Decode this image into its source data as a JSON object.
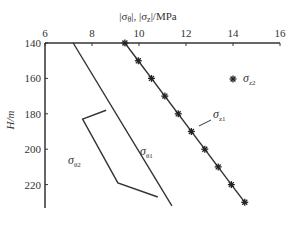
{
  "chart_data": {
    "type": "line",
    "title": "",
    "xlabel": "|σθ|, |σz|/MPa",
    "ylabel": "H/m",
    "x_axis_position": "top",
    "y_inverted": true,
    "xlim": [
      6,
      16
    ],
    "ylim": [
      140,
      232
    ],
    "xticks": [
      6,
      8,
      10,
      12,
      14,
      16
    ],
    "yticks": [
      140,
      160,
      180,
      200,
      220
    ],
    "grid": false,
    "series": [
      {
        "name": "σθ1",
        "style": "line",
        "points": [
          [
            7.2,
            140
          ],
          [
            11.4,
            232
          ]
        ]
      },
      {
        "name": "σθ2",
        "style": "line",
        "points": [
          [
            8.6,
            178
          ],
          [
            7.6,
            183
          ],
          [
            9.1,
            219
          ],
          [
            10.8,
            227
          ]
        ]
      },
      {
        "name": "σz1",
        "style": "line",
        "points": [
          [
            9.4,
            140
          ],
          [
            14.5,
            230
          ]
        ]
      },
      {
        "name": "σz2",
        "style": "markers-star",
        "points": [
          [
            9.4,
            140
          ],
          [
            9.97,
            150
          ],
          [
            10.53,
            160
          ],
          [
            11.1,
            170
          ],
          [
            11.67,
            180
          ],
          [
            12.23,
            190
          ],
          [
            12.8,
            200
          ],
          [
            13.37,
            210
          ],
          [
            13.93,
            220
          ],
          [
            14.5,
            230
          ]
        ]
      }
    ],
    "annotations": [
      {
        "text": "σθ1",
        "x": 10.1,
        "y": 186
      },
      {
        "text": "σθ2",
        "x": 7.1,
        "y": 192
      },
      {
        "text": "σz1",
        "x": 13.9,
        "y": 181
      }
    ],
    "legend": [
      {
        "symbol": "star",
        "label": "σz2"
      }
    ]
  },
  "labels": {
    "xlabel_main": "|σ",
    "xlabel_sub_theta": "θ",
    "xlabel_mid": "|, |σ",
    "xlabel_sub_z": "z",
    "xlabel_end": "|/MPa",
    "ylabel": "H/m",
    "sigma": "σ",
    "sub_theta1": "θ1",
    "sub_theta2": "θ2",
    "sub_z1": "z1",
    "sub_z2": "z2"
  }
}
